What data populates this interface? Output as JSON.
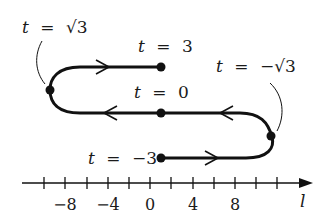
{
  "diagram": {
    "type": "parametric-path-on-line",
    "colors": {
      "stroke": "#111111",
      "background": "#ffffff"
    },
    "labels": {
      "t_sqrt3": {
        "var": "t",
        "eq": "=",
        "value": "√3"
      },
      "t_3": {
        "var": "t",
        "eq": "=",
        "value": "3"
      },
      "t_0": {
        "var": "t",
        "eq": "=",
        "value": "0"
      },
      "t_neg_sqrt3": {
        "var": "t",
        "eq": "=",
        "value": "−√3"
      },
      "t_neg3": {
        "var": "t",
        "eq": "=",
        "value": "−3"
      }
    },
    "axis": {
      "label": "l",
      "tick_labels": [
        "−8",
        "−4",
        "0",
        "4",
        "8"
      ],
      "tick_step": 2,
      "tick_range": [
        -10,
        12
      ]
    },
    "points": [
      {
        "t": "-3",
        "position": "bottom start"
      },
      {
        "t": "-√3",
        "position": "right turn"
      },
      {
        "t": "0",
        "position": "middle"
      },
      {
        "t": "√3",
        "position": "left turn"
      },
      {
        "t": "3",
        "position": "top end"
      }
    ]
  }
}
